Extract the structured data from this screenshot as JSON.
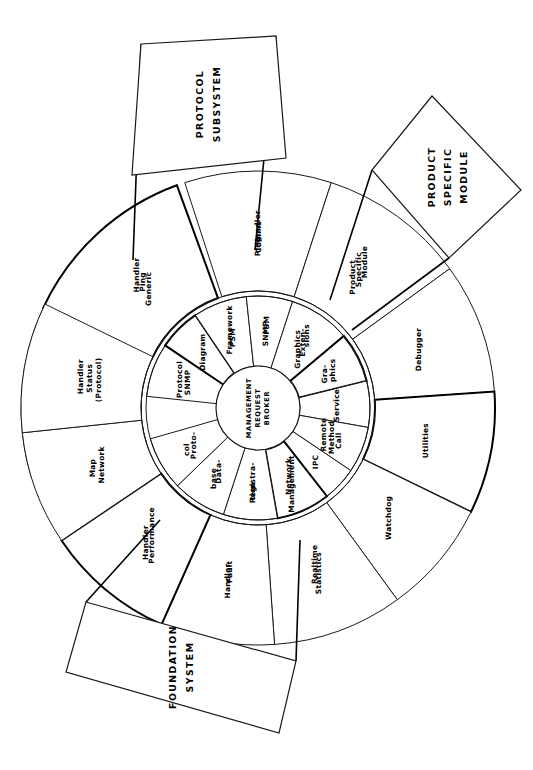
{
  "diagram": {
    "orientation_degrees": 90,
    "hub": {
      "name": "management-request-broker",
      "lines": [
        "MANAGEMENT",
        "REQUEST",
        "BROKER"
      ]
    },
    "inner_ring": [
      {
        "id": "snmp-protocol",
        "lines": [
          "SNMP",
          "Protocol"
        ],
        "a0": 186,
        "a1": 214
      },
      {
        "id": "diagram",
        "lines": [
          "Diagram"
        ],
        "a0": 214,
        "a1": 236
      },
      {
        "id": "psm-framework",
        "lines": [
          "PSM",
          "Framework"
        ],
        "a0": 236,
        "a1": 264
      },
      {
        "id": "snmp-psm",
        "lines": [
          "SNMP",
          "PSM"
        ],
        "a0": 264,
        "a1": 288
      },
      {
        "id": "graphics-extensions",
        "lines": [
          "Graphics",
          "Exten-",
          "sions"
        ],
        "a0": 288,
        "a1": 320
      },
      {
        "id": "graphics",
        "lines": [
          "Gra-",
          "phics"
        ],
        "a0": 320,
        "a1": 346
      },
      {
        "id": "service",
        "lines": [
          "Service"
        ],
        "a0": 346,
        "a1": 370
      },
      {
        "id": "remote-method-call",
        "lines": [
          "Remote",
          "Method",
          "Call"
        ],
        "a0": 370,
        "a1": 394
      },
      {
        "id": "ipc",
        "lines": [
          "IPC"
        ],
        "a0": 394,
        "a1": 412
      },
      {
        "id": "network-management",
        "lines": [
          "Network",
          "Management"
        ],
        "a0": 412,
        "a1": 440
      },
      {
        "id": "registration",
        "lines": [
          "Registra-",
          "tion"
        ],
        "a0": 440,
        "a1": 468
      },
      {
        "id": "database",
        "lines": [
          "Data-",
          "base"
        ],
        "a0": 468,
        "a1": 496
      },
      {
        "id": "protocol",
        "lines": [
          "Proto-",
          "col"
        ],
        "a0": 496,
        "a1": 524
      }
    ],
    "outer_ring": [
      {
        "id": "protocol-comms-handler",
        "lines": [
          "(Protocol)",
          "Comms",
          "Handler"
        ],
        "a0": 163,
        "a1": 205
      },
      {
        "id": "generic-ping-handler",
        "lines": [
          "Generic",
          "Ping",
          "Handler"
        ],
        "a0": 205,
        "a1": 250
      },
      {
        "id": "ping-comms-handler",
        "lines": [
          "Ping",
          "Comms",
          "Handler"
        ],
        "a0": 252,
        "a1": 288
      },
      {
        "id": "product-specific-module",
        "lines": [
          "Product",
          "Specific",
          "Module"
        ],
        "a0": 288,
        "a1": 324
      },
      {
        "id": "debugger",
        "lines": [
          "Debugger"
        ],
        "a0": 324,
        "a1": 356
      },
      {
        "id": "utilities",
        "lines": [
          "Utilities"
        ],
        "a0": 356,
        "a1": 386
      },
      {
        "id": "watchdog",
        "lines": [
          "Watchdog"
        ],
        "a0": 386,
        "a1": 414
      },
      {
        "id": "realtime-statistics",
        "lines": [
          "Realtime",
          "Statistics"
        ],
        "a0": 414,
        "a1": 446
      },
      {
        "id": "fault-handler",
        "lines": [
          "Fault",
          "Handler"
        ],
        "a0": 446,
        "a1": 474
      },
      {
        "id": "performance-handler",
        "lines": [
          "Performance",
          "Handler"
        ],
        "a0": 474,
        "a1": 506
      },
      {
        "id": "network-map",
        "lines": [
          "Network",
          "Map"
        ],
        "a0": 506,
        "a1": 534
      },
      {
        "id": "protocol-status-handler",
        "lines": [
          "(Protocol)",
          "Status",
          "Handler"
        ],
        "a0": 534,
        "a1": 566
      }
    ],
    "callouts": [
      {
        "id": "protocol-subsystem",
        "lines": [
          "PROTOCOL",
          "SUBSYSTEM"
        ]
      },
      {
        "id": "product-specific-module",
        "lines": [
          "PRODUCT",
          "SPECIFIC",
          "MODULE"
        ]
      },
      {
        "id": "foundation-system",
        "lines": [
          "FOUNDATION",
          "SYSTEM"
        ]
      }
    ],
    "colors": {
      "stroke": "#1a1a1a",
      "fill": "#ffffff",
      "text": "#000000"
    }
  }
}
